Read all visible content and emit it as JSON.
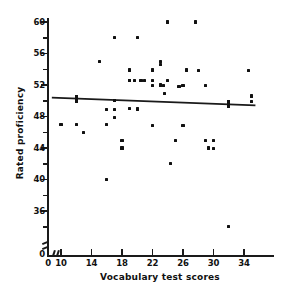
{
  "chart_data": {
    "type": "scatter",
    "title": "",
    "xlabel": "Vocabulary test scores",
    "ylabel": "Rated proficiency",
    "xlim": [
      8.5,
      36
    ],
    "ylim": [
      33,
      61
    ],
    "grid": false,
    "legend": "none",
    "axis_breaks": {
      "x": true,
      "y": true
    },
    "xticks": [
      0,
      10,
      14,
      18,
      22,
      26,
      30,
      34
    ],
    "xtick_labels": [
      "0",
      "10",
      "14",
      "18",
      "22",
      "26",
      "30",
      "34"
    ],
    "yticks": [
      36,
      40,
      44,
      48,
      52,
      56,
      60
    ],
    "ytick_labels": [
      "36",
      "40",
      "44",
      "48",
      "52",
      "56",
      "60"
    ],
    "y_minor_ticks": [
      34,
      38,
      42,
      46,
      50,
      54,
      58
    ],
    "y_origin_label": "0",
    "x": [
      10,
      12,
      13,
      15,
      16,
      16,
      16,
      17,
      17,
      17,
      17,
      18,
      18,
      19,
      19,
      19,
      19.6,
      20,
      20.4,
      20.5,
      20,
      21,
      22,
      22,
      22,
      22,
      23,
      23,
      23.4,
      23.6,
      24,
      24,
      24.4,
      25,
      25.4,
      25.6,
      26,
      26,
      26.4,
      27.6,
      28,
      29,
      29,
      29.4,
      30,
      30,
      32,
      34.6,
      35,
      35,
      17,
      19,
      12,
      20,
      23
    ],
    "y": [
      47,
      47,
      46,
      55,
      48.9,
      47,
      40,
      58,
      50,
      47.9,
      48.9,
      45,
      44,
      53.9,
      52.6,
      52.6,
      52.6,
      58,
      52.6,
      52.6,
      48.9,
      52.6,
      53.9,
      52.6,
      46.9,
      51.9,
      55,
      54.6,
      51.9,
      50.9,
      60,
      52.6,
      42,
      45,
      51.8,
      51.8,
      51.9,
      46.9,
      53.9,
      60,
      53.8,
      51.9,
      45,
      44,
      43.9,
      45,
      34,
      53.8,
      50.6,
      49.9,
      50,
      49,
      50.2,
      49,
      52
    ],
    "n_points": 55,
    "regression_line": {
      "x_start": 8.8,
      "y_start": 50.4,
      "x_end": 35.5,
      "y_end": 49.4,
      "slope": -0.037,
      "markers_at_x": [
        12,
        32
      ]
    }
  },
  "axis": {
    "x_title": "Vocabulary test scores",
    "y_title": "Rated proficiency"
  }
}
